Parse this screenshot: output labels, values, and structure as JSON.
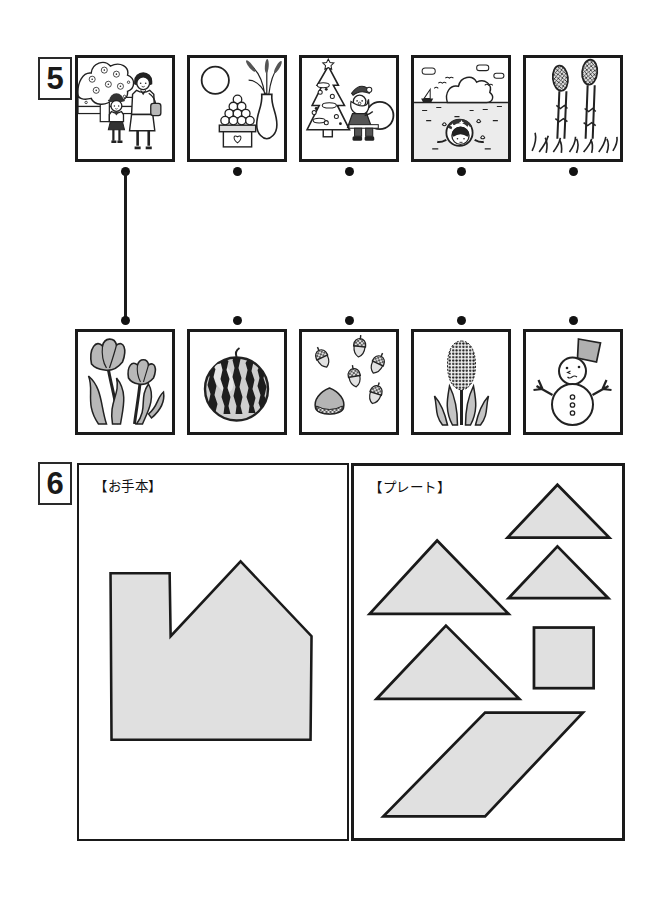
{
  "page_title": "Seasonal matching and tangram worksheet",
  "section5": {
    "number": "5",
    "top_row": [
      {
        "name": "entrance-ceremony-picture",
        "description": "mother and child at school entrance ceremony under cherry blossoms (spring)"
      },
      {
        "name": "tsukimi-picture",
        "description": "full moon, stacked dango and pampas grass in vase (autumn moon viewing)"
      },
      {
        "name": "christmas-picture",
        "description": "Santa Claus with sack beside decorated Christmas tree (winter)"
      },
      {
        "name": "sea-swimming-picture",
        "description": "child swimming in the sea with swim ring, big cumulus cloud (summer)"
      },
      {
        "name": "tsukushi-picture",
        "description": "two horsetail sprouts growing from grass (early spring)"
      }
    ],
    "bottom_row": [
      {
        "name": "tulips-picture",
        "description": "two tulip flowers with leaves"
      },
      {
        "name": "watermelon-picture",
        "description": "striped watermelon"
      },
      {
        "name": "acorns-picture",
        "description": "scattered acorns and a chestnut"
      },
      {
        "name": "hyacinth-picture",
        "description": "hyacinth flower spike with leaves"
      },
      {
        "name": "snowman-picture",
        "description": "snowman with bucket hat and stick arms"
      }
    ],
    "answer_line": {
      "from": "top row picture 1",
      "to": "bottom row picture 1"
    }
  },
  "section6": {
    "number": "6",
    "model_label": "【お手本】",
    "plate_label": "【プレート】",
    "model_shape": "house-with-chimney",
    "plates": [
      "medium-triangle",
      "large-triangle",
      "medium-triangle",
      "large-triangle",
      "square",
      "parallelogram"
    ],
    "colors": {
      "plate_fill": "#e0e0e0",
      "ink": "#1a1a1a",
      "illustration_gray": "#b8b8b8"
    }
  }
}
